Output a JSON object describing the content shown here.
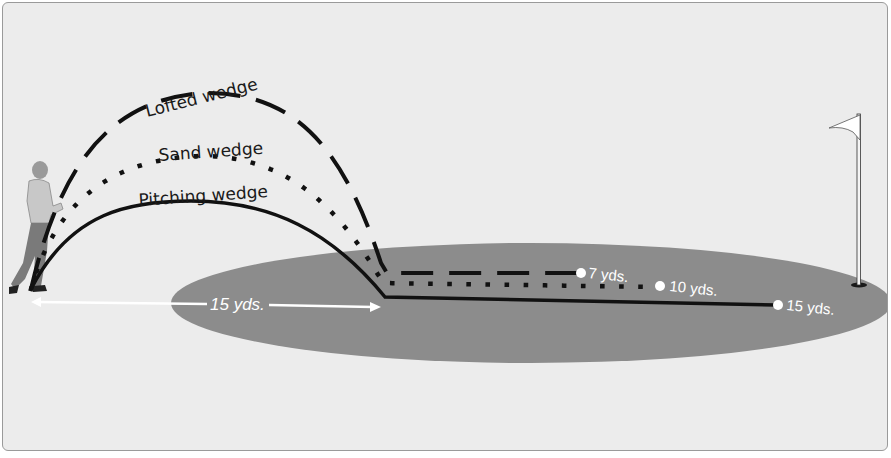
{
  "diagram": {
    "type": "golf-chip-shot-trajectories",
    "colors": {
      "background": "#ececec",
      "green": "#8c8c8c",
      "trajectory": "#111111",
      "annotation": "#ffffff"
    },
    "trajectories": [
      {
        "name": "lofted",
        "label": "Lofted wedge",
        "style": "dashed",
        "rollout_label": "7 yds."
      },
      {
        "name": "sand",
        "label": "Sand wedge",
        "style": "dotted",
        "rollout_label": "10 yds."
      },
      {
        "name": "pitching",
        "label": "Pitching wedge",
        "style": "solid",
        "rollout_label": "15 yds."
      }
    ],
    "carry_distance_label": "15 yds.",
    "objects": {
      "golfer": "golfer-figure",
      "flagstick": "flag-icon",
      "green": "putting-green"
    }
  }
}
